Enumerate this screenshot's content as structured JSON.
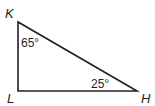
{
  "diagram": {
    "type": "right-triangle",
    "stroke_color": "#231f20",
    "vertices": [
      {
        "label": "K",
        "x": 18,
        "y": 22
      },
      {
        "label": "L",
        "x": 18,
        "y": 91
      },
      {
        "label": "H",
        "x": 137,
        "y": 91
      }
    ],
    "angles": [
      {
        "vertex": "K",
        "label": "65°"
      },
      {
        "vertex": "H",
        "label": "25°"
      }
    ]
  }
}
